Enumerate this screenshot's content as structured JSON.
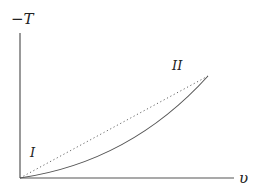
{
  "diagram": {
    "axes": {
      "y_label": "−T",
      "x_label": "υ"
    },
    "points": [
      {
        "id": "I",
        "label": "I"
      },
      {
        "id": "II",
        "label": "II"
      }
    ],
    "curves": [
      {
        "name": "dotted-straight-path",
        "style": "dotted",
        "from": "I",
        "to": "II"
      },
      {
        "name": "solid-convex-path",
        "style": "solid",
        "from": "I",
        "to": "II"
      }
    ],
    "colors": {
      "axis": "#555555",
      "curve": "#555555",
      "text": "#222222"
    }
  }
}
